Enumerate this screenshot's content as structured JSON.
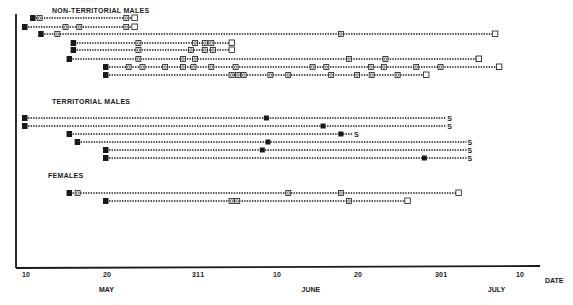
{
  "chart_data": {
    "type": "timeline",
    "title": "",
    "xlabel": "DATE",
    "ylabel": "",
    "x_axis": {
      "origin_date": "May 10",
      "ticks": [
        {
          "label": "10",
          "day": 0
        },
        {
          "label": "20",
          "day": 10
        },
        {
          "label": "31",
          "day": 21
        },
        {
          "label": "1",
          "day": 22
        },
        {
          "label": "10",
          "day": 31
        },
        {
          "label": "20",
          "day": 41
        },
        {
          "label": "30",
          "day": 51
        },
        {
          "label": "1",
          "day": 52
        },
        {
          "label": "10",
          "day": 61
        }
      ],
      "months": [
        {
          "label": "MAY",
          "day": 10
        },
        {
          "label": "JUNE",
          "day": 35
        },
        {
          "label": "JULY",
          "day": 58
        }
      ],
      "range_days": [
        0,
        63
      ]
    },
    "legend_symbols": {
      "M": "filled square = marked/first capture",
      "circle-square": "recapture",
      "open-square": "last observation",
      "S": "end marker (territorial)"
    },
    "groups": [
      {
        "name": "NON-TERRITORIAL MALES",
        "label_y": 10,
        "rows": [
          {
            "y": 18,
            "start": 1,
            "end": 13.5,
            "recaptures": [
              1.8,
              12.5
            ],
            "end_symbol": "open-square"
          },
          {
            "y": 27,
            "start": 0,
            "end": 13.5,
            "recaptures": [
              5,
              6.7,
              12.5
            ],
            "end_symbol": "open-square"
          },
          {
            "y": 34,
            "start": 2,
            "end": 58,
            "recaptures": [
              4,
              39
            ],
            "end_symbol": "open-square"
          },
          {
            "y": 43,
            "start": 6,
            "end": 25.5,
            "recaptures": [
              14,
              21,
              22.2,
              23
            ],
            "end_symbol": "open-square"
          },
          {
            "y": 50,
            "start": 6,
            "end": 25.5,
            "recaptures": [
              14,
              20.5,
              22.2,
              23.2
            ],
            "end_symbol": "open-square"
          },
          {
            "y": 59,
            "start": 5.5,
            "end": 56,
            "recaptures": [
              14,
              19.5,
              21,
              40,
              44.5,
              56
            ],
            "end_symbol": "open-square"
          },
          {
            "y": 67,
            "start": 10,
            "end": 58.5,
            "recaptures": [
              12.8,
              14.5,
              17.3,
              19.5,
              20.8,
              23,
              26,
              35.5,
              37.2,
              42.7,
              44.3,
              48.3,
              51.3,
              58.5
            ],
            "end_symbol": "open-square"
          },
          {
            "y": 75,
            "start": 10,
            "end": 49.5,
            "recaptures": [
              25.5,
              26.3,
              27,
              30.3,
              32.5,
              37.8,
              41,
              42.8,
              46
            ],
            "end_symbol": "open-square"
          }
        ]
      },
      {
        "name": "TERRITORIAL MALES",
        "label_y": 101,
        "rows": [
          {
            "y": 118,
            "start": 0,
            "end": 52,
            "territory_day": 29.8,
            "end_symbol": "S"
          },
          {
            "y": 126,
            "start": 0,
            "end": 52,
            "territory_day": 36.8,
            "end_symbol": "S"
          },
          {
            "y": 134,
            "start": 5.5,
            "end": 40.5,
            "territory_day": 39,
            "end_symbol": "S"
          },
          {
            "y": 142,
            "start": 6.5,
            "end": 54.5,
            "territory_day": 30,
            "end_symbol": "S"
          },
          {
            "y": 150,
            "start": 10,
            "end": 54.5,
            "territory_day": 29.3,
            "end_symbol": "S"
          },
          {
            "y": 158,
            "start": 10,
            "end": 54.5,
            "territory_day": 49.3,
            "end_symbol": "S"
          }
        ]
      },
      {
        "name": "FEMALES",
        "label_y": 176,
        "rows": [
          {
            "y": 193,
            "start": 5.5,
            "end": 53.5,
            "recaptures": [
              6.5,
              32.5,
              39
            ],
            "end_symbol": "open-square"
          },
          {
            "y": 201,
            "start": 10,
            "end": 47.2,
            "recaptures": [
              25.5,
              26.2,
              40
            ],
            "end_symbol": "open-square"
          }
        ]
      }
    ]
  },
  "labels": {
    "non_territorial": "NON-TERRITORIAL  MALES",
    "territorial": "TERRITORIAL  MALES",
    "females": "FEMALES",
    "date": "DATE",
    "month_may": "MAY",
    "month_june": "JUNE",
    "month_july": "JULY",
    "marker_m": "M",
    "marker_s": "S"
  }
}
